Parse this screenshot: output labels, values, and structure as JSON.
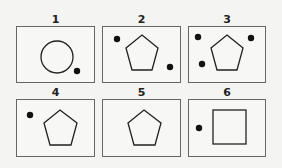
{
  "panels": [
    {
      "label": "1",
      "shape": "circle",
      "dots": 1
    },
    {
      "label": "2",
      "shape": "pentagon",
      "dots": 2
    },
    {
      "label": "3",
      "shape": "pentagon",
      "dots": 3
    },
    {
      "label": "4",
      "shape": "pentagon",
      "dots": 1
    },
    {
      "label": "5",
      "shape": "pentagon",
      "dots": 0
    },
    {
      "label": "6",
      "shape": "square",
      "dots": 1
    }
  ],
  "colors": {
    "stroke": "#222222",
    "dot": "#111111",
    "border": "#666666"
  }
}
